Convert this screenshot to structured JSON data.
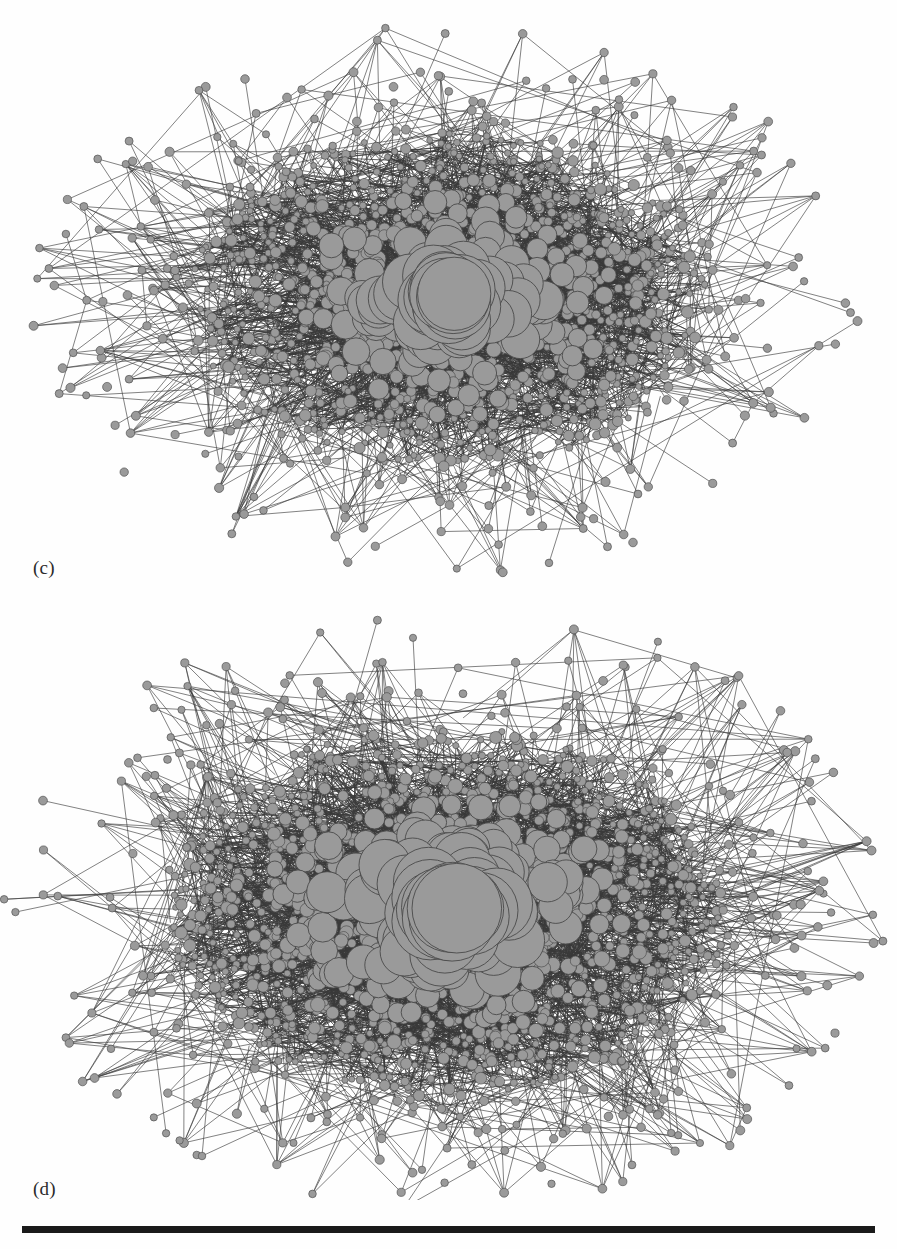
{
  "page": {
    "background_color": "#fefefe",
    "width": 897,
    "height": 1249
  },
  "figure": {
    "caption_c": "(c)",
    "caption_d": "(d)",
    "node_fill_color": "#9a9a9a",
    "node_stroke_color": "#4a4a4a",
    "edge_color": "#3a3a3a",
    "rule_color": "#1a1a1a"
  },
  "footer": {
    "rule_label": "horizontal-rule"
  },
  "chart_data": [
    {
      "type": "scatter",
      "id": "panel-c",
      "title": "(c)",
      "subtitle": "",
      "xlabel": "",
      "ylabel": "",
      "legend": [],
      "grid": false,
      "description": "Force-directed network graph, dense hairball layout. Gray circular nodes sized by degree over a near-black mass of overlapping thin edges, with sparse long-edge leaf nodes radiating to the periphery.",
      "layout": {
        "center_x": 448,
        "center_y": 300,
        "core_radius_x": 258,
        "core_radius_y": 168,
        "halo_radius_x": 352,
        "halo_radius_y": 232,
        "extent_x": [
          40,
          872
        ],
        "extent_y": [
          35,
          580
        ]
      },
      "counts": {
        "core_nodes": 1150,
        "hub_nodes": 210,
        "peripheral_nodes": 230,
        "core_edges": 2600,
        "peripheral_edges": 430
      },
      "node_size_range": [
        3,
        34
      ],
      "seed": 1734
    },
    {
      "type": "scatter",
      "id": "panel-d",
      "title": "(d)",
      "subtitle": "",
      "xlabel": "",
      "ylabel": "",
      "legend": [],
      "grid": false,
      "description": "Force-directed network graph of the same system at a later/denser stage. Larger gray hub nodes cluster at the core, surrounded by a thicker black edge mass and a broader fringe of leaf nodes on long edges.",
      "layout": {
        "center_x": 448,
        "center_y": 310,
        "core_radius_x": 278,
        "core_radius_y": 188,
        "halo_radius_x": 372,
        "halo_radius_y": 258,
        "extent_x": [
          38,
          868
        ],
        "extent_y": [
          635,
          1205
        ]
      },
      "counts": {
        "core_nodes": 1450,
        "hub_nodes": 280,
        "peripheral_nodes": 270,
        "core_edges": 3100,
        "peripheral_edges": 520
      },
      "node_size_range": [
        3,
        42
      ],
      "seed": 90210
    }
  ]
}
